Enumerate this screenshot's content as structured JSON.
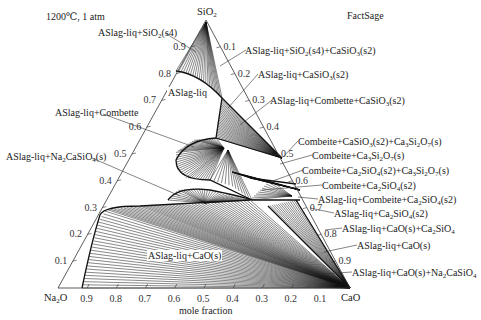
{
  "header": {
    "conditions": "1200℃, 1 atm",
    "software": "FactSage"
  },
  "vertices": {
    "top": {
      "base": "SiO",
      "sub": "2"
    },
    "left": {
      "base": "Na",
      "sub": "2",
      "tail": "O"
    },
    "right": {
      "base": "CaO"
    }
  },
  "axis": {
    "xlabel": "mole fraction",
    "bottom_ticks": [
      "0.9",
      "0.8",
      "0.7",
      "0.6",
      "0.5",
      "0.4",
      "0.3",
      "0.2",
      "0.1"
    ],
    "left_ticks": [
      "0.1",
      "0.2",
      "0.3",
      "0.4",
      "0.5",
      "0.6",
      "0.7",
      "0.8",
      "0.9"
    ],
    "right_ticks": [
      "0.1",
      "0.2",
      "0.3",
      "0.4",
      "0.5",
      "0.6",
      "0.7",
      "0.8",
      "0.9"
    ]
  },
  "phase_labels": {
    "sio2_s4": "ASlag-liq+SiO2(s4)",
    "aslag_liq": "ASlag-liq",
    "combette": "ASlag-liq+Combette",
    "na2casio4_s": "ASlag-liq+Na2CaSiO4(s)",
    "cao_s_center": "ASlag-liq+CaO(s)",
    "sio2_casio3": "ASlag-liq+SiO2(s4)+CaSiO3(s2)",
    "casio3": "ASlag-liq+CaSiO3(s2)",
    "combette_casio3": "ASlag-liq+Combette+CaSiO3(s2)",
    "combeite_casio3_ca3si2o7": "Combeite+CaSiO3(s2)+Ca3Si2O7(s)",
    "combeite_ca3si2o7": "Combeite+Ca3Si2O7(s)",
    "combeite_ca2sio4_ca3si2o7": "Combeite+Ca2SiO4(s2)+Ca3Si2O7(s)",
    "combeite_ca2sio4": "Combeite+Ca2SiO4(s2)",
    "aslag_combeite_ca2sio4": "ASlag-liq+Combeite+Ca2SiO4(s2)",
    "aslag_ca2sio4": "ASlag-liq+Ca2SiO4(s2)",
    "aslag_cao_ca2sio4": "ASlag-liq+CaO(s)+Ca2SiO4",
    "aslag_cao": "ASlag-liq+CaO(s)",
    "aslag_cao_na2casio4": "ASlag-liq+CaO(s)+Na2CaSiO4"
  },
  "chart_data": {
    "type": "ternary_phase_diagram",
    "temperature": "1200℃",
    "pressure": "1 atm",
    "software": "FactSage",
    "components": [
      "SiO2",
      "Na2O",
      "CaO"
    ],
    "axis_label": "mole fraction",
    "tick_values": [
      0.1,
      0.2,
      0.3,
      0.4,
      0.5,
      0.6,
      0.7,
      0.8,
      0.9
    ],
    "regions": [
      "ASlag-liq+SiO2(s4)",
      "ASlag-liq",
      "ASlag-liq+Combette",
      "ASlag-liq+Na2CaSiO4(s)",
      "ASlag-liq+CaO(s)",
      "ASlag-liq+SiO2(s4)+CaSiO3(s2)",
      "ASlag-liq+CaSiO3(s2)",
      "ASlag-liq+Combette+CaSiO3(s2)",
      "Combeite+CaSiO3(s2)+Ca3Si2O7(s)",
      "Combeite+Ca3Si2O7(s)",
      "Combeite+Ca2SiO4(s2)+Ca3Si2O7(s)",
      "Combeite+Ca2SiO4(s2)",
      "ASlag-liq+Combeite+Ca2SiO4(s2)",
      "ASlag-liq+Ca2SiO4(s2)",
      "ASlag-liq+CaO(s)+Ca2SiO4",
      "ASlag-liq+CaO(s)",
      "ASlag-liq+CaO(s)+Na2CaSiO4"
    ]
  }
}
